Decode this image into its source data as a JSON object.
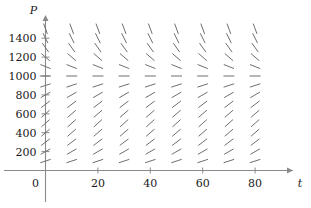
{
  "figure": {
    "name": "slope-field-logistic",
    "background": "#ffffff",
    "ink_color": "#6f6f6f",
    "axis_color": "#8a8a8a",
    "text_color": "#1a1a1a"
  },
  "chart_data": {
    "type": "scatter",
    "subtype": "slope-field",
    "title": "",
    "xlabel": "t",
    "ylabel": "P",
    "xlim": [
      -8,
      92
    ],
    "ylim": [
      -110,
      1560
    ],
    "grid": false,
    "legend": null,
    "x_ticks_major": [
      0,
      20,
      40,
      60,
      80
    ],
    "x_tick_labels": [
      "0",
      "20",
      "40",
      "60",
      "80"
    ],
    "y_ticks_major": [
      200,
      400,
      600,
      800,
      1000,
      1200,
      1400
    ],
    "y_tick_labels": [
      "200",
      "400",
      "600",
      "800",
      "1000",
      "1200",
      "1400"
    ],
    "y_ticks_minor": [
      100,
      300,
      500,
      700,
      900,
      1100,
      1300,
      1500
    ],
    "equilibrium": 1000,
    "segment_grid_t": [
      0,
      10,
      20,
      30,
      40,
      50,
      60,
      70,
      80
    ],
    "segment_grid_P": [
      100,
      200,
      300,
      400,
      500,
      600,
      700,
      800,
      900,
      1000,
      1100,
      1200,
      1300,
      1400,
      1500
    ],
    "slope_model": "dP/dt = k*P*(1 - P/1000)",
    "slope_k": 0.0001,
    "segment_half_length_px": 11,
    "slope_values_by_P": {
      "100": 0.009,
      "200": 0.016,
      "300": 0.021,
      "400": 0.024,
      "500": 0.025,
      "600": 0.024,
      "700": 0.021,
      "800": 0.016,
      "900": 0.009,
      "1000": 0.0,
      "1100": -0.011,
      "1200": -0.024,
      "1300": -0.039,
      "1400": -0.056,
      "1500": -0.075
    }
  },
  "axes": {
    "y_axis_name": "P",
    "x_axis_name": "t",
    "origin_label": "0"
  }
}
